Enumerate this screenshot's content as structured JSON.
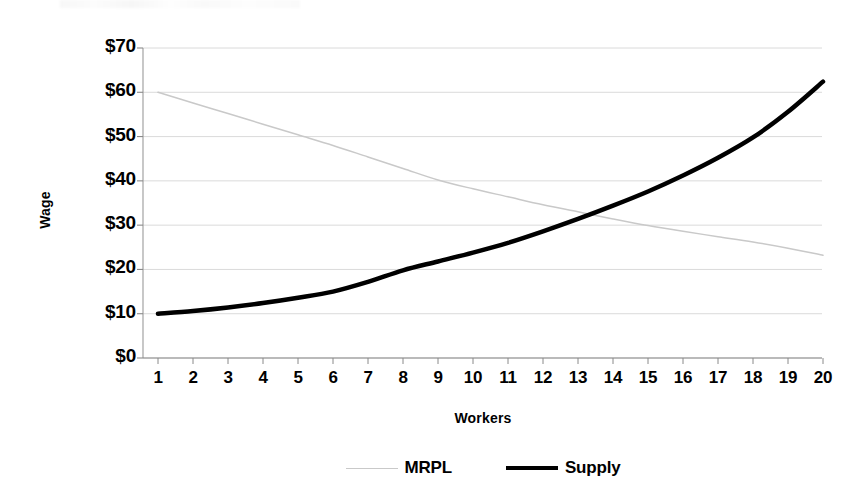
{
  "chart_data": {
    "type": "line",
    "title": "",
    "xlabel": "Workers",
    "ylabel": "Wage",
    "xlim": [
      1,
      20
    ],
    "ylim": [
      0,
      70
    ],
    "grid": true,
    "legend_position": "bottom",
    "x_tick_labels": [
      "1",
      "2",
      "3",
      "4",
      "5",
      "6",
      "7",
      "8",
      "9",
      "10",
      "11",
      "12",
      "13",
      "14",
      "15",
      "16",
      "17",
      "18",
      "19",
      "20"
    ],
    "y_tick_labels": [
      "$0",
      "$10",
      "$20",
      "$30",
      "$40",
      "$50",
      "$60",
      "$70"
    ],
    "y_tick_values": [
      0,
      10,
      20,
      30,
      40,
      50,
      60,
      70
    ],
    "x": [
      1,
      2,
      3,
      4,
      5,
      6,
      7,
      8,
      9,
      10,
      11,
      12,
      13,
      14,
      15,
      16,
      17,
      18,
      19,
      20
    ],
    "series": [
      {
        "name": "MRPL",
        "color": "#c9c9c9",
        "width": 1.5,
        "values": [
          60.0,
          57.6,
          55.2,
          52.8,
          50.4,
          48.0,
          45.4,
          42.8,
          40.2,
          38.2,
          36.4,
          34.6,
          33.0,
          31.4,
          29.9,
          28.6,
          27.4,
          26.2,
          24.8,
          23.2
        ]
      },
      {
        "name": "Supply",
        "color": "#000000",
        "width": 4.5,
        "values": [
          10.0,
          10.6,
          11.4,
          12.4,
          13.6,
          15.0,
          17.2,
          19.8,
          21.8,
          23.8,
          26.0,
          28.6,
          31.4,
          34.4,
          37.6,
          41.2,
          45.2,
          49.8,
          55.6,
          62.4
        ]
      }
    ],
    "intersection": {
      "x": 13.5,
      "y": 32
    }
  },
  "legend": {
    "items": [
      {
        "label": "MRPL",
        "key": "mrpl"
      },
      {
        "label": "Supply",
        "key": "supply"
      }
    ]
  }
}
